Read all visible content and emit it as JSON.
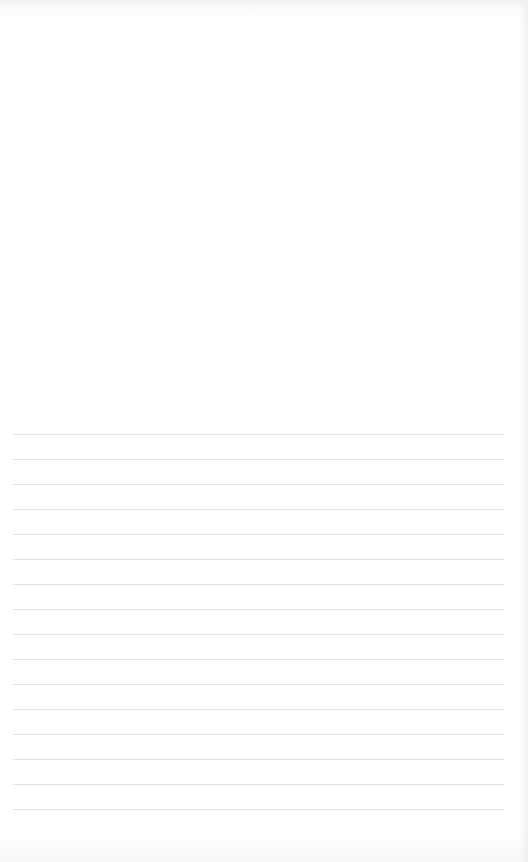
{
  "page": {
    "type": "blank lined notepaper",
    "background_color": "#ffffff",
    "line_color": "#e3e3e3"
  },
  "ruled_lines": {
    "count": 16,
    "first_y": 434,
    "spacing": 25,
    "left": 13,
    "right": 504
  }
}
